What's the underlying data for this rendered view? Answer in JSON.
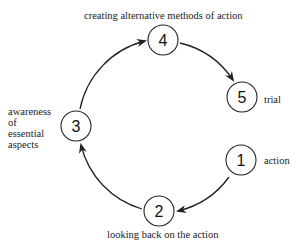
{
  "diagram": {
    "type": "cycle",
    "nodes": [
      {
        "id": "1",
        "number": "1",
        "label": "action"
      },
      {
        "id": "2",
        "number": "2",
        "label": "looking back on the action"
      },
      {
        "id": "3",
        "number": "3",
        "label_lines": [
          "awareness",
          "of",
          "essential",
          "aspects"
        ]
      },
      {
        "id": "4",
        "number": "4",
        "label": "creating alternative methods of action"
      },
      {
        "id": "5",
        "number": "5",
        "label": "trial"
      }
    ],
    "edges": [
      {
        "from": "1",
        "to": "2"
      },
      {
        "from": "2",
        "to": "3"
      },
      {
        "from": "3",
        "to": "4"
      },
      {
        "from": "4",
        "to": "5"
      }
    ],
    "colors": {
      "stroke": "#222222",
      "background": "#ffffff",
      "text": "#222222"
    }
  }
}
